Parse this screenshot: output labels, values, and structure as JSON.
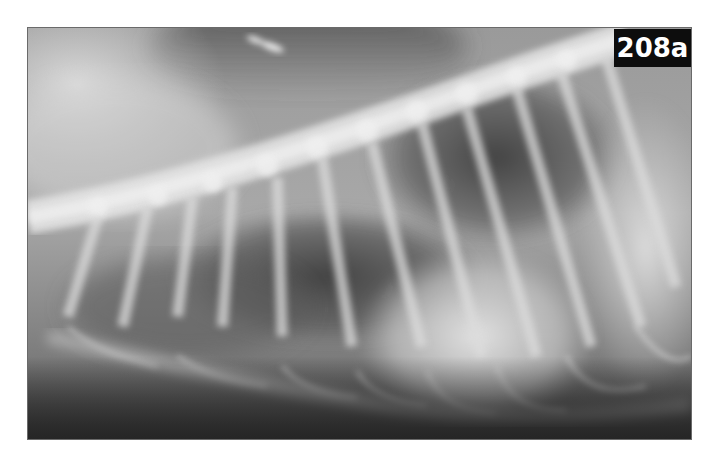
{
  "figure": {
    "label": "208a",
    "colors": {
      "label_background": "#0d0d0d",
      "label_text": "#ffffff",
      "page_background": "#ffffff"
    }
  }
}
